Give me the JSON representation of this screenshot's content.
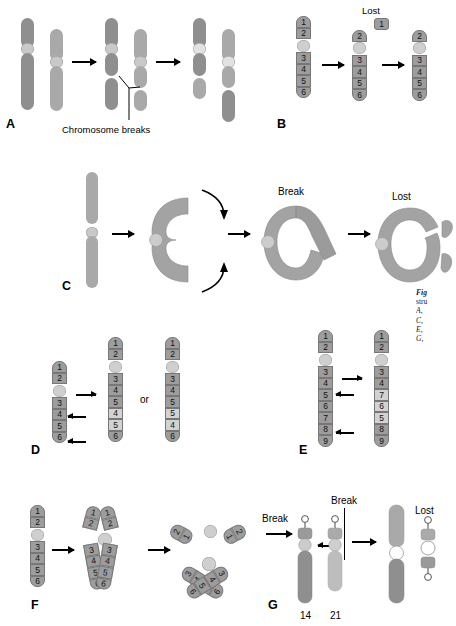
{
  "figure": {
    "title_fragment": "Fig",
    "caption_lines": [
      "Fig",
      "stru",
      "A, ",
      "C, ",
      "E, ",
      "G, "
    ],
    "background": "#ffffff",
    "colors": {
      "chromatid_dark": "#8f8f8f",
      "chromatid_light": "#a9a9a9",
      "chromatid_very_light": "#bdbdbd",
      "centromere": "#c9c9c9",
      "band_fill": "#9d9d9d",
      "band_pale_fill": "#d2d2d2",
      "band_stroke": "#777777",
      "text": "#000000"
    }
  },
  "panels": [
    {
      "id": "A",
      "letter": "A",
      "name": "reciprocal-translocation",
      "labels": [
        {
          "text": "Chromosome breaks",
          "name": "chromosome-breaks-label"
        }
      ],
      "steps": 3
    },
    {
      "id": "B",
      "letter": "B",
      "name": "terminal-deletion",
      "labels": [
        {
          "text": "Lost",
          "name": "lost-label"
        }
      ],
      "chromosomes": [
        {
          "name": "original",
          "bands_p": [
            "1",
            "2"
          ],
          "bands_q": [
            "3",
            "4",
            "5",
            "6"
          ]
        },
        {
          "name": "after-break",
          "bands_p": [
            "2"
          ],
          "bands_q": [
            "3",
            "4",
            "5",
            "6"
          ]
        },
        {
          "name": "deleted-result",
          "bands_p": [
            "2"
          ],
          "bands_q": [
            "3",
            "4",
            "5",
            "6"
          ]
        }
      ],
      "lost_fragment_bands": [
        "1"
      ]
    },
    {
      "id": "C",
      "letter": "C",
      "name": "ring-chromosome",
      "labels": [
        {
          "text": "Break",
          "name": "break-label"
        },
        {
          "text": "Lost",
          "name": "lost-label"
        }
      ],
      "steps": 4
    },
    {
      "id": "D",
      "letter": "D",
      "name": "duplication",
      "labels": [
        {
          "text": "or",
          "name": "or-label"
        }
      ],
      "chromosomes": [
        {
          "name": "original",
          "bands_p": [
            "1",
            "2"
          ],
          "bands_q": [
            "3",
            "4",
            "5",
            "6"
          ]
        },
        {
          "name": "tandem-duplication",
          "bands_p": [
            "1",
            "2"
          ],
          "bands_q": [
            "3",
            "4",
            "5",
            "4",
            "5",
            "6"
          ],
          "pale_indices": [
            3,
            4
          ]
        },
        {
          "name": "inverted-duplication",
          "bands_p": [
            "1",
            "2"
          ],
          "bands_q": [
            "3",
            "4",
            "5",
            "5",
            "4",
            "6"
          ],
          "pale_indices": [
            3,
            4
          ]
        }
      ]
    },
    {
      "id": "E",
      "letter": "E",
      "name": "inversion",
      "labels": [],
      "chromosomes": [
        {
          "name": "original",
          "bands_p": [
            "1",
            "2"
          ],
          "bands_q": [
            "3",
            "4",
            "5",
            "6",
            "7",
            "8",
            "9"
          ]
        },
        {
          "name": "inverted",
          "bands_p": [
            "1",
            "2"
          ],
          "bands_q": [
            "3",
            "4",
            "7",
            "6",
            "5",
            "8",
            "9"
          ],
          "pale_indices": [
            2,
            3,
            4
          ]
        }
      ]
    },
    {
      "id": "F",
      "letter": "F",
      "name": "isochromosome",
      "labels": [],
      "chromosomes": [
        {
          "name": "original",
          "bands_p": [
            "1",
            "2"
          ],
          "bands_q": [
            "3",
            "4",
            "5",
            "6"
          ]
        },
        {
          "name": "metaphase-two-chromatids",
          "bands_p": [
            "1",
            "2"
          ],
          "bands_q": [
            "3",
            "4",
            "5",
            "6"
          ]
        },
        {
          "name": "isochromosome-short-arm",
          "arms": [
            [
              "2",
              "1"
            ],
            [
              "2",
              "1"
            ]
          ]
        },
        {
          "name": "isochromosome-long-arm",
          "arms": [
            [
              "3",
              "4",
              "5",
              "6"
            ],
            [
              "3",
              "4",
              "5",
              "6"
            ]
          ]
        }
      ]
    },
    {
      "id": "G",
      "letter": "G",
      "name": "robertsonian-translocation",
      "labels": [
        {
          "text": "Break",
          "name": "break-label-left"
        },
        {
          "text": "Break",
          "name": "break-label-top"
        },
        {
          "text": "Lost",
          "name": "lost-label"
        },
        {
          "text": "14",
          "name": "chromosome-14-label"
        },
        {
          "text": "21",
          "name": "chromosome-21-label"
        }
      ]
    }
  ]
}
